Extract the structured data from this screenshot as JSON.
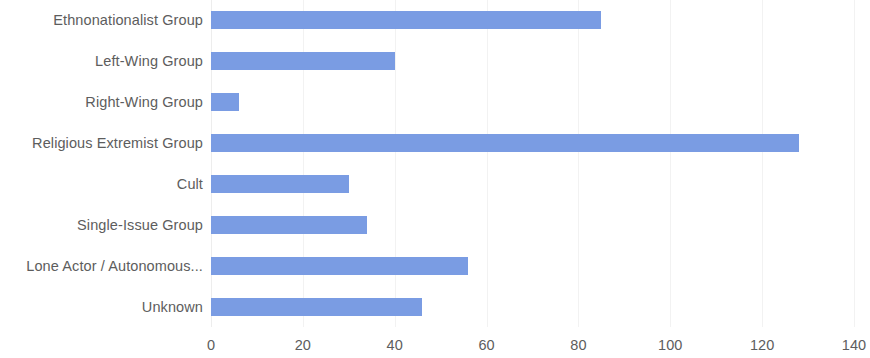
{
  "chart_data": {
    "type": "bar",
    "orientation": "horizontal",
    "title": "",
    "subtitle": "",
    "xlabel": "",
    "ylabel": "",
    "xlim": [
      0,
      140
    ],
    "xticks": [
      0,
      20,
      40,
      60,
      80,
      100,
      120,
      140
    ],
    "xtick_labels": [
      "0",
      "20",
      "40",
      "60",
      "80",
      "100",
      "120",
      "140"
    ],
    "grid": {
      "vertical": true,
      "horizontal": false
    },
    "legend": {
      "show": false,
      "position": "none"
    },
    "bar_color": "#7a9ce3",
    "text_color": "#5d5d5d",
    "gridline_color": "#f2f2f2",
    "background_color": "#ffffff",
    "categories": [
      "Ethnonationalist Group",
      "Left-Wing Group",
      "Right-Wing Group",
      "Religious Extremist Group",
      "Cult",
      "Single-Issue Group",
      "Lone Actor / Autonomous...",
      "Unknown"
    ],
    "values": [
      85,
      40,
      6,
      128,
      30,
      34,
      56,
      46
    ]
  }
}
